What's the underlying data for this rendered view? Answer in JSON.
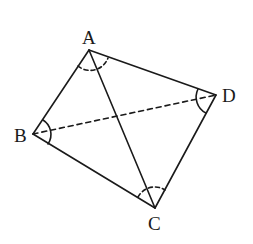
{
  "diagram": {
    "type": "quadrilateral",
    "stroke_color": "#1a1a1a",
    "background": "#ffffff",
    "vertices": {
      "A": {
        "label": "A",
        "x": 89,
        "y": 50
      },
      "B": {
        "label": "B",
        "x": 33,
        "y": 134
      },
      "C": {
        "label": "C",
        "x": 155,
        "y": 208
      },
      "D": {
        "label": "D",
        "x": 216,
        "y": 95
      }
    },
    "labels": {
      "A": "A",
      "B": "B",
      "C": "C",
      "D": "D"
    },
    "edges": [
      {
        "from": "A",
        "to": "B",
        "style": "solid"
      },
      {
        "from": "A",
        "to": "D",
        "style": "solid"
      },
      {
        "from": "B",
        "to": "C",
        "style": "solid"
      },
      {
        "from": "C",
        "to": "D",
        "style": "solid"
      },
      {
        "from": "A",
        "to": "C",
        "style": "solid",
        "role": "diagonal"
      },
      {
        "from": "B",
        "to": "D",
        "style": "dashed",
        "role": "diagonal"
      }
    ],
    "angle_marks": [
      {
        "vertex": "A",
        "style": "dashed"
      },
      {
        "vertex": "B",
        "style": "solid"
      },
      {
        "vertex": "C",
        "style": "dashed"
      },
      {
        "vertex": "D",
        "style": "solid"
      }
    ]
  }
}
